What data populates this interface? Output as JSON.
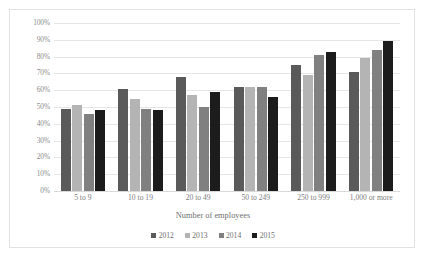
{
  "chart_data": {
    "type": "bar",
    "title": "",
    "xlabel": "Number of employees",
    "ylabel": "",
    "ylim": [
      0,
      100
    ],
    "ytick_labels": [
      "100%",
      "90%",
      "80%",
      "70%",
      "60%",
      "50%",
      "40%",
      "30%",
      "20%",
      "10%",
      "0%"
    ],
    "ytick_values": [
      100,
      90,
      80,
      70,
      60,
      50,
      40,
      30,
      20,
      10,
      0
    ],
    "grid": true,
    "legend_position": "bottom",
    "categories": [
      "5 to 9",
      "10 to 19",
      "20 to 49",
      "50 to 249",
      "250 to 999",
      "1,000 or more"
    ],
    "series": [
      {
        "name": "2012",
        "color": "#5a5a5a",
        "values": [
          49,
          61,
          68,
          62,
          75,
          71
        ]
      },
      {
        "name": "2013",
        "color": "#b4b4b4",
        "values": [
          51,
          55,
          57,
          62,
          69,
          79
        ]
      },
      {
        "name": "2014",
        "color": "#808080",
        "values": [
          46,
          49,
          50,
          62,
          81,
          84
        ]
      },
      {
        "name": "2015",
        "color": "#1c1c1c",
        "values": [
          48,
          48,
          59,
          56,
          83,
          89
        ]
      }
    ]
  }
}
